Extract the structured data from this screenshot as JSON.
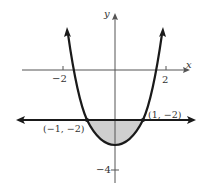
{
  "diagram": {
    "title": "",
    "axes": {
      "x_label": "x",
      "y_label": "y",
      "x_ticks": [
        {
          "value": -2,
          "label": "−2"
        },
        {
          "value": 2,
          "label": "2"
        }
      ],
      "y_ticks": [
        {
          "value": -4,
          "label": "−4"
        }
      ]
    },
    "curves": [
      {
        "name": "parabola",
        "description": "upward-opening parabola with vertex near (0, -3)",
        "stroke": "#1a1a1a"
      },
      {
        "name": "horizontal-line",
        "equation": "y = -2",
        "stroke": "#1a1a1a"
      }
    ],
    "points": [
      {
        "label": "(−1, −2)",
        "x": -1,
        "y": -2
      },
      {
        "label": "(1, −2)",
        "x": 1,
        "y": -2
      }
    ],
    "shaded_region": {
      "description": "region between parabola and line y = -2",
      "fill": "#cfcfcf"
    }
  }
}
